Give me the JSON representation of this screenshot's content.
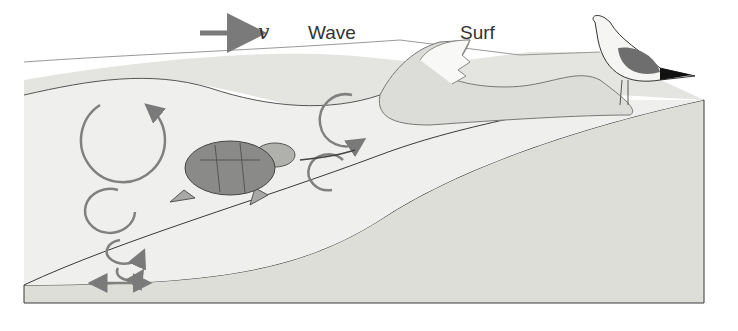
{
  "diagram": {
    "labels": {
      "velocity_symbol": "v",
      "wave": "Wave",
      "surf": "Surf"
    },
    "elements": [
      "direction-arrow",
      "wave-crest",
      "breaking-surf",
      "orbital-motion-circles",
      "sea-turtle",
      "seagull",
      "sand-beach-cross-section"
    ],
    "colors": {
      "sand": "#e0e0dc",
      "water": "#e6e6e4",
      "arrow": "#7a7a7a",
      "outline": "#3a3a3a",
      "turtle_shell": "#8a8a8a",
      "gull_wing": "#6e6e6e"
    }
  }
}
